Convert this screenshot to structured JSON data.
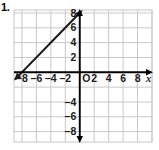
{
  "problem": {
    "number": "1."
  },
  "colors": {
    "background": "#ffffff",
    "grid": "#c8c8c8",
    "axis": "#000000",
    "line": "#1a1a1a",
    "text": "#1a1a1a"
  },
  "chart_data": {
    "type": "line",
    "title": "",
    "xlabel": "x",
    "ylabel": "",
    "xlim": [
      -9.1,
      10.0
    ],
    "ylim": [
      -9.4,
      8.4
    ],
    "grid": true,
    "grid_step": 2,
    "legend": "none",
    "origin_label": "O",
    "xticks": [
      -8,
      -6,
      -4,
      -2,
      2,
      4,
      6,
      8
    ],
    "xtick_labels": [
      "-8",
      "-6",
      "-4",
      "-2",
      "2",
      "4",
      "6",
      "8"
    ],
    "yticks": [
      8,
      6,
      4,
      2,
      -4,
      -6,
      -8
    ],
    "ytick_labels": [
      "8",
      "6",
      "4",
      "2",
      "-4",
      "-6",
      "-8"
    ],
    "series": [
      {
        "name": "line",
        "equation": "y = x + 8",
        "slope": 1,
        "intercept": 8,
        "x_intercept": -8,
        "arrows": "both",
        "points": [
          {
            "x": -9.1,
            "y": -1.1
          },
          {
            "x": 0,
            "y": 8
          },
          {
            "x": 0.5,
            "y": 8.5
          }
        ]
      }
    ],
    "annotations": []
  }
}
